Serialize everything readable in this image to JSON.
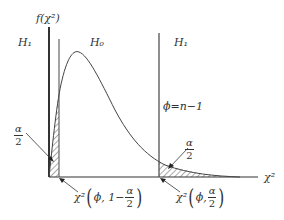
{
  "diagram": {
    "type": "chi-square distribution two-tailed test",
    "y_axis_label": "f(χ²)",
    "x_axis_label": "χ²",
    "regions": {
      "left_reject": "H₁",
      "accept": "H₀",
      "right_reject": "H₁"
    },
    "dof_label": "ϕ=n−1",
    "tail_area_left": {
      "numerator": "α",
      "denominator": "2"
    },
    "tail_area_right": {
      "numerator": "α",
      "denominator": "2"
    },
    "lower_critical": {
      "prefix": "χ²",
      "args": "ϕ, 1−",
      "frac_num": "α",
      "frac_den": "2"
    },
    "upper_critical": {
      "prefix": "χ²",
      "args": "ϕ, ",
      "frac_num": "α",
      "frac_den": "2"
    },
    "colors": {
      "ink": "#333333",
      "line": "#444444",
      "hatch": "#555555"
    }
  }
}
